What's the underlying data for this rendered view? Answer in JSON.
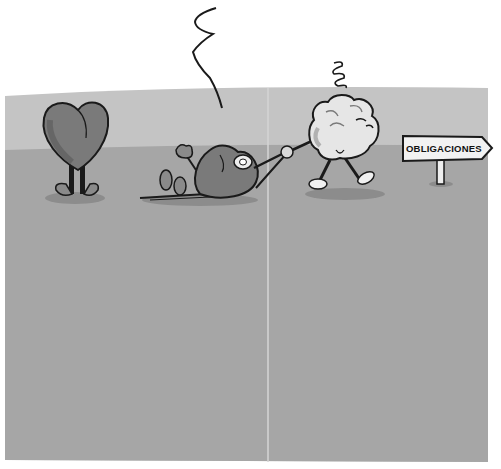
{
  "illustration": {
    "description": "Cartoon: a brain character drags a tired heart character toward a signpost, while another heart stands behind",
    "colors": {
      "background": "#ffffff",
      "sky_band": "#c4c4c4",
      "ground": "#a6a6a6",
      "fold_line": "#d2d2d2",
      "heart": "#7a7a7a",
      "heart_shadow": "#5e5e5e",
      "brain": "#e6e6e6",
      "outline": "#1a1a1a"
    },
    "characters": [
      {
        "id": "standing-heart",
        "label": "Standing heart"
      },
      {
        "id": "dragged-heart",
        "label": "Heart lying down being dragged"
      },
      {
        "id": "brain",
        "label": "Brain walking, dizzy"
      }
    ],
    "sign": {
      "text": "OBLIGACIONES"
    }
  }
}
